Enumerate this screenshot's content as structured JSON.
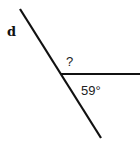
{
  "diagram": {
    "type": "angle-diagram",
    "line_label": "d",
    "unknown_angle_label": "?",
    "known_angle_label": "59°",
    "known_angle_value": 59,
    "line_color": "#111111",
    "text_color": "#222222"
  }
}
